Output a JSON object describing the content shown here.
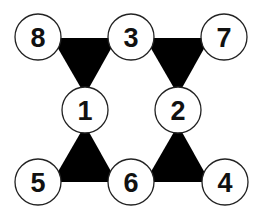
{
  "diagram": {
    "colors": {
      "triangle": "#000000",
      "node_fill": "#ffffff",
      "node_stroke": "#222222",
      "text": "#111111"
    },
    "nodes": [
      {
        "id": "n8",
        "label": "8",
        "x": 38,
        "y": 37
      },
      {
        "id": "n3",
        "label": "3",
        "x": 131,
        "y": 37
      },
      {
        "id": "n7",
        "label": "7",
        "x": 224,
        "y": 37
      },
      {
        "id": "n1",
        "label": "1",
        "x": 85,
        "y": 110
      },
      {
        "id": "n2",
        "label": "2",
        "x": 178,
        "y": 110
      },
      {
        "id": "n5",
        "label": "5",
        "x": 38,
        "y": 182
      },
      {
        "id": "n6",
        "label": "6",
        "x": 131,
        "y": 182
      },
      {
        "id": "n4",
        "label": "4",
        "x": 225,
        "y": 182
      }
    ],
    "triangles": [
      {
        "id": "t-8-3-1",
        "vertices": [
          "8",
          "3",
          "1"
        ]
      },
      {
        "id": "t-3-7-2",
        "vertices": [
          "3",
          "7",
          "2"
        ]
      },
      {
        "id": "t-1-5-6",
        "vertices": [
          "1",
          "5",
          "6"
        ]
      },
      {
        "id": "t-2-6-4",
        "vertices": [
          "2",
          "6",
          "4"
        ]
      }
    ]
  }
}
